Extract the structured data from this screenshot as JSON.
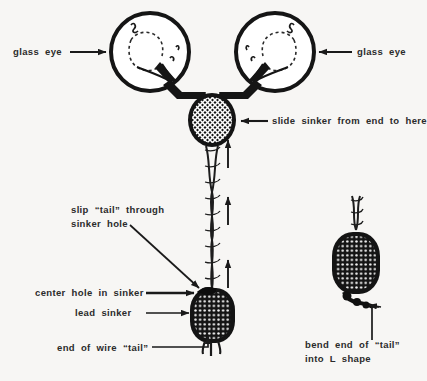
{
  "diagram": {
    "background_color": "#f7f6f4",
    "ink_color": "#1a1a1a",
    "text_color": "#2b2b2b"
  },
  "labels": {
    "glass_eye_left": "glass  eye",
    "glass_eye_right": "glass  eye",
    "slide_sinker": "slide  sinker  from  end  to  here",
    "slip_tail_line1": "slip  “tail”  through",
    "slip_tail_line2": "sinker  hole",
    "center_hole": "center  hole  in  sinker",
    "lead_sinker": "lead  sinker",
    "end_of_wire": "end  of  wire  “tail”",
    "bend_end_line1": "bend  end  of  “tail”",
    "bend_end_line2": "into  L  shape"
  },
  "parts": {
    "glass_eye_left": "glass-eye-left",
    "glass_eye_right": "glass-eye-right",
    "connector_bar": "wire-connector-bar",
    "top_sinker": "slide-sinker-top",
    "twisted_wire": "twisted-wire-tail",
    "lower_sinker": "lead-sinker-lower",
    "side_sinker": "lead-sinker-side",
    "l_bend": "wire-l-bend"
  },
  "annotations": {
    "wire_direction_arrows": 3,
    "wire_direction": "up"
  }
}
